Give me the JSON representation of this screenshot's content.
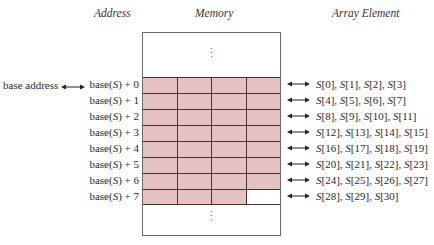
{
  "headers": {
    "address": "Address",
    "memory": "Memory",
    "array_element": "Array Element"
  },
  "base_label": "base address",
  "memory": {
    "top_ellipsis": "⋮",
    "bottom_ellipsis": "⋮",
    "cells_per_row": 4,
    "shaded_color": "#e6c3c3",
    "grid_line_color": "#4a2f2f"
  },
  "rows": [
    {
      "address_prefix": "base(",
      "address_var": "S",
      "address_suffix": ") + 0",
      "elements": "[0], S[1], S[2], S[3]",
      "elements_full": "S[0], S[1], S[2], S[3]",
      "filled": 4
    },
    {
      "address_prefix": "base(",
      "address_var": "S",
      "address_suffix": ") + 1",
      "elements_full": "S[4], S[5], S[6], S[7]",
      "filled": 4
    },
    {
      "address_prefix": "base(",
      "address_var": "S",
      "address_suffix": ") + 2",
      "elements_full": "S[8], S[9], S[10], S[11]",
      "filled": 4
    },
    {
      "address_prefix": "base(",
      "address_var": "S",
      "address_suffix": ") + 3",
      "elements_full": "S[12], S[13], S[14], S[15]",
      "filled": 4
    },
    {
      "address_prefix": "base(",
      "address_var": "S",
      "address_suffix": ") + 4",
      "elements_full": "S[16], S[17], S[18], S[19]",
      "filled": 4
    },
    {
      "address_prefix": "base(",
      "address_var": "S",
      "address_suffix": ") + 5",
      "elements_full": "S[20], S[21], S[22], S[23]",
      "filled": 4
    },
    {
      "address_prefix": "base(",
      "address_var": "S",
      "address_suffix": ") + 6",
      "elements_full": "S[24], S[25], S[26], S[27]",
      "filled": 4
    },
    {
      "address_prefix": "base(",
      "address_var": "S",
      "address_suffix": ") + 7",
      "elements_full": "S[28], S[29], S[30]",
      "filled": 3
    }
  ]
}
